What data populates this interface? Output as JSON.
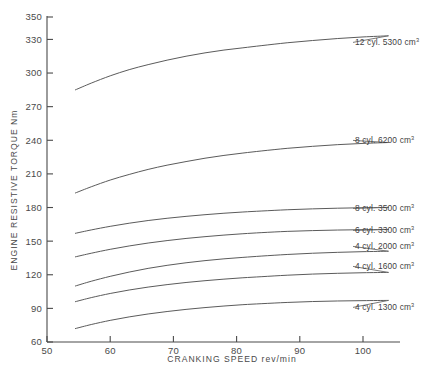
{
  "chart_data": {
    "type": "line",
    "title": "",
    "xlabel": "CRANKING SPEED  rev/min",
    "ylabel": "ENGINE RESISTIVE TORQUE  Nm",
    "xlim": [
      50,
      105
    ],
    "ylim": [
      60,
      350
    ],
    "xticks": [
      50,
      60,
      70,
      80,
      90,
      100
    ],
    "yticks": [
      60,
      90,
      120,
      150,
      180,
      210,
      240,
      270,
      300,
      330,
      350
    ],
    "grid": false,
    "legend_position": "right-inline-labels",
    "x": [
      54.5,
      57,
      60,
      63,
      66,
      69,
      72,
      75,
      78,
      81,
      84,
      88,
      92,
      96,
      100,
      104
    ],
    "series": [
      {
        "name": "12 cyl. 5300 cm3",
        "label_cyl": "12 cyl.",
        "label_disp": "5300 cm",
        "label_sup": "3",
        "values": [
          285,
          291,
          297.5,
          303,
          307.5,
          311.5,
          315,
          318,
          320.5,
          322.5,
          324.5,
          327,
          329,
          330.8,
          332.2,
          333.2
        ]
      },
      {
        "name": "8 cyl. 6200 cm3",
        "label_cyl": "8 cyl.",
        "label_disp": "6200 cm",
        "label_sup": "3",
        "values": [
          193,
          198.5,
          204.5,
          209.5,
          214,
          217.8,
          221,
          224,
          226.5,
          228.6,
          230.5,
          232.8,
          234.6,
          236.1,
          237.2,
          238.0
        ]
      },
      {
        "name": "8 cyl. 3500 cm3",
        "label_cyl": "8 cyl.",
        "label_disp": "3500 cm",
        "label_sup": "3",
        "values": [
          157,
          160,
          163.2,
          166,
          168.4,
          170.4,
          172.1,
          173.6,
          174.9,
          176.0,
          176.9,
          178.0,
          178.8,
          179.4,
          179.8,
          180.1
        ]
      },
      {
        "name": "6 cyl. 3300 cm3",
        "label_cyl": "6 cyl.",
        "label_disp": "3300 cm",
        "label_sup": "3",
        "values": [
          136,
          139.2,
          142.7,
          145.7,
          148.3,
          150.5,
          152.4,
          154.0,
          155.4,
          156.6,
          157.6,
          158.7,
          159.4,
          159.9,
          160.2,
          160.4
        ]
      },
      {
        "name": "4 cyl. 2000 cm3",
        "label_cyl": "4 cyl.",
        "label_disp": "2000 cm",
        "label_sup": "3",
        "values": [
          110,
          114.2,
          118.6,
          122.4,
          125.7,
          128.4,
          130.7,
          132.6,
          134.2,
          135.5,
          136.7,
          138.1,
          139.2,
          140.0,
          140.6,
          141.0
        ]
      },
      {
        "name": "4 cyl. 1600 cm3",
        "label_cyl": "4 cyl.",
        "label_disp": "1600 cm",
        "label_sup": "3",
        "values": [
          96,
          99.6,
          103.3,
          106.4,
          109.0,
          111.2,
          113.1,
          114.7,
          116.1,
          117.3,
          118.3,
          119.6,
          120.6,
          121.3,
          121.8,
          122.1
        ]
      },
      {
        "name": "4 cyl. 1300 cm3",
        "label_cyl": "4 cyl.",
        "label_disp": "1300 cm",
        "label_sup": "3",
        "values": [
          72,
          75.6,
          79.3,
          82.4,
          85.0,
          87.2,
          89.1,
          90.7,
          92.1,
          93.3,
          94.2,
          95.3,
          96.1,
          96.6,
          96.9,
          97.1
        ]
      }
    ],
    "series_label_anchor": [
      {
        "y": 45
      },
      {
        "y": 143
      },
      {
        "y": 211
      },
      {
        "y": 233
      },
      {
        "y": 249
      },
      {
        "y": 269
      },
      {
        "y": 310
      }
    ]
  }
}
